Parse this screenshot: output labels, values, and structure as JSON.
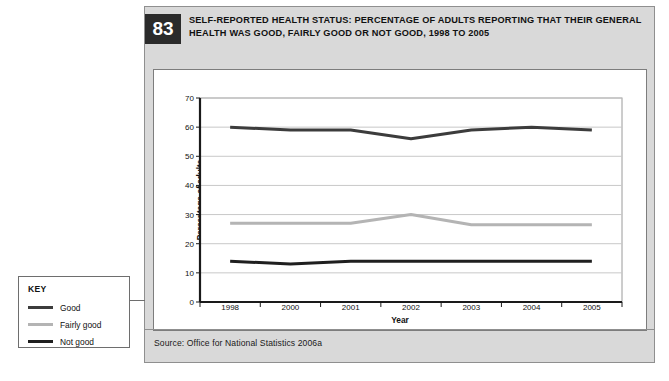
{
  "figure": {
    "number": "83",
    "title": "SELF-REPORTED HEALTH STATUS: PERCENTAGE OF ADULTS REPORTING THAT THEIR GENERAL HEALTH WAS GOOD, FAIRLY GOOD OR NOT GOOD, 1998 TO 2005",
    "source": "Source: Office for National Statistics 2006a"
  },
  "key": {
    "title": "KEY",
    "items": [
      {
        "label": "Good",
        "color": "#3c3c3c"
      },
      {
        "label": "Fairly good",
        "color": "#b4b4b4"
      },
      {
        "label": "Not good",
        "color": "#1f1f1f"
      }
    ]
  },
  "chart_data": {
    "type": "line",
    "title": "SELF-REPORTED HEALTH STATUS: PERCENTAGE OF ADULTS REPORTING THAT THEIR GENERAL HEALTH WAS GOOD, FAIRLY GOOD OR NOT GOOD, 1998 TO 2005",
    "xlabel": "Year",
    "ylabel": "Percentage of adults",
    "categories": [
      "1998",
      "2000",
      "2001",
      "2002",
      "2003",
      "2004",
      "2005"
    ],
    "ylim": [
      0,
      70
    ],
    "yticks": [
      0,
      10,
      20,
      30,
      40,
      50,
      60,
      70
    ],
    "grid": true,
    "legend_position": "external-left",
    "series": [
      {
        "name": "Good",
        "color": "#3c3c3c",
        "values": [
          60,
          59,
          59,
          56,
          59,
          60,
          59
        ]
      },
      {
        "name": "Fairly good",
        "color": "#b4b4b4",
        "values": [
          27,
          27,
          27,
          30,
          26.5,
          26.5,
          26.5
        ]
      },
      {
        "name": "Not good",
        "color": "#1f1f1f",
        "values": [
          14,
          13,
          14,
          14,
          14,
          14,
          14
        ]
      }
    ]
  }
}
